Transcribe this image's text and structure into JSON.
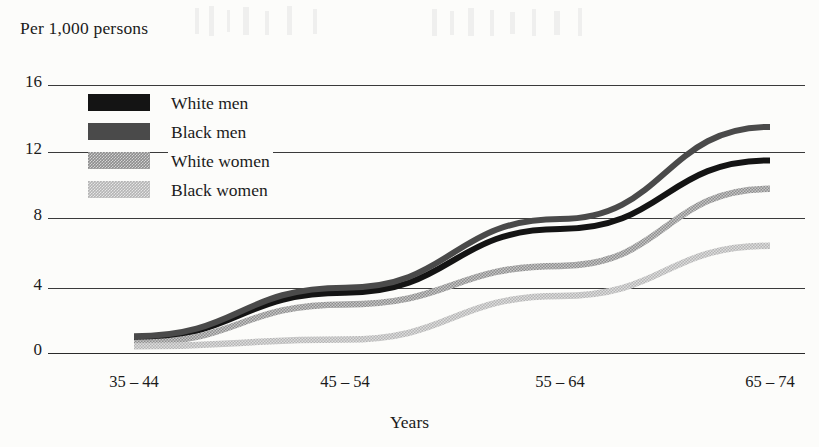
{
  "chart_data": {
    "type": "line",
    "title": "",
    "ylabel": "Per 1,000 persons",
    "xlabel": "Years",
    "categories": [
      "35 – 44",
      "45 – 54",
      "55 – 64",
      "65 – 74"
    ],
    "yticks": [
      "0",
      "4",
      "8",
      "12",
      "16"
    ],
    "ylim": [
      0,
      16
    ],
    "grid": "horizontal",
    "legend_position": "upper-left-inside",
    "series": [
      {
        "name": "White men",
        "color": "#141414",
        "values": [
          0.9,
          3.6,
          7.4,
          11.5
        ]
      },
      {
        "name": "Black men",
        "color": "#4a4a4a",
        "values": [
          1.0,
          3.9,
          8.0,
          13.5
        ]
      },
      {
        "name": "White women",
        "color": "#8d8d8d",
        "values": [
          0.6,
          2.9,
          5.2,
          9.8
        ]
      },
      {
        "name": "Black women",
        "color": "#b4b4b4",
        "values": [
          0.4,
          0.8,
          3.4,
          6.4
        ]
      }
    ]
  },
  "legend": {
    "items": [
      {
        "label": "White men"
      },
      {
        "label": "Black men"
      },
      {
        "label": "White women"
      },
      {
        "label": "Black women"
      }
    ]
  }
}
